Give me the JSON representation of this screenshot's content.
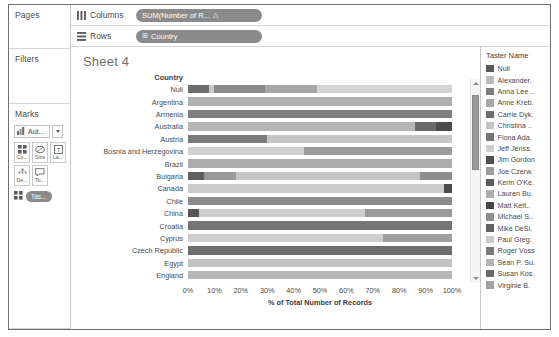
{
  "window": {
    "sheet_title": "Sheet 4"
  },
  "rail": {
    "pages": {
      "title": "Pages"
    },
    "filters": {
      "title": "Filters"
    },
    "marks": {
      "title": "Marks",
      "mark_type": {
        "label": "Aut...",
        "icon": "bar-mark-icon",
        "dropdown_icon": "chevron-down-icon"
      },
      "buttons": [
        {
          "name": "color",
          "caption": "Co...",
          "icon": "color-squares-icon"
        },
        {
          "name": "size",
          "caption": "Size",
          "icon": "size-icon"
        },
        {
          "name": "label",
          "caption": "La...",
          "icon": "label-text-icon"
        },
        {
          "name": "detail",
          "caption": "De...",
          "icon": "detail-icon"
        },
        {
          "name": "tooltip",
          "caption": "To...",
          "icon": "tooltip-icon"
        }
      ],
      "encoding_pill": {
        "label": "Tas...",
        "icon": "color-squares-icon"
      }
    }
  },
  "shelves": [
    {
      "name": "columns",
      "icon": "columns-icon",
      "label": "Columns",
      "pill": {
        "text": "SUM(Number of R...",
        "field_icon": "△"
      }
    },
    {
      "name": "rows",
      "icon": "rows-icon",
      "label": "Rows",
      "pill": {
        "text": "Country",
        "field_icon": "⊞"
      }
    }
  ],
  "legend": {
    "title": "Taster Name",
    "items": [
      {
        "label": "Null",
        "color": "#585858"
      },
      {
        "label": "Alexander.",
        "color": "#b9b9b9"
      },
      {
        "label": "Anna Lee ..",
        "color": "#7d7d7d"
      },
      {
        "label": "Anne Kreb.",
        "color": "#a8a8a8"
      },
      {
        "label": "Carrie Dyk.",
        "color": "#6e6e6e"
      },
      {
        "label": "Christina ..",
        "color": "#c4c4c4"
      },
      {
        "label": "Fiona Ada.",
        "color": "#757575"
      },
      {
        "label": "Jeff Jenss.",
        "color": "#cfcfcf"
      },
      {
        "label": "Jim Gordon",
        "color": "#4f4f4f"
      },
      {
        "label": "Joe Czerw.",
        "color": "#9c9c9c"
      },
      {
        "label": "Kerin O'Ke.",
        "color": "#5c5c5c"
      },
      {
        "label": "Lauren Bu.",
        "color": "#adadad"
      },
      {
        "label": "Matt Kett..",
        "color": "#464646"
      },
      {
        "label": "Michael S..",
        "color": "#8f8f8f"
      },
      {
        "label": "Mike DeSi.",
        "color": "#636363"
      },
      {
        "label": "Paul Greg.",
        "color": "#c9c9c9"
      },
      {
        "label": "Roger Voss",
        "color": "#7a7a7a"
      },
      {
        "label": "Sean P. Su.",
        "color": "#b3b3b3"
      },
      {
        "label": "Susan Kos.",
        "color": "#6a6a6a"
      },
      {
        "label": "Virginie B.",
        "color": "#a2a2a2"
      }
    ]
  },
  "chart_data": {
    "type": "bar",
    "orientation": "horizontal",
    "stacked": true,
    "normalized_percent": true,
    "title": "Sheet 4",
    "row_field_header": "Country",
    "xlabel": "% of Total Number of Records",
    "ylabel": "Country",
    "xlim": [
      0,
      100
    ],
    "xticks": [
      "0%",
      "10%",
      "20%",
      "30%",
      "40%",
      "50%",
      "60%",
      "70%",
      "80%",
      "90%",
      "100%"
    ],
    "grid": false,
    "legend_position": "right",
    "legend_title": "Taster Name",
    "categories": [
      "Null",
      "Argentina",
      "Armenia",
      "Australia",
      "Austria",
      "Bosnia and Herzegovina",
      "Brazil",
      "Bulgaria",
      "Canada",
      "Chile",
      "China",
      "Croatia",
      "Cyprus",
      "Czech Republic",
      "Egypt",
      "England"
    ],
    "rows": [
      {
        "category": "Null",
        "segments": [
          {
            "taster": "Null",
            "color": "#6e6e6e",
            "percent": 8
          },
          {
            "taster": "Alexander.",
            "color": "#c9c9c9",
            "percent": 2
          },
          {
            "taster": "Anna Lee ..",
            "color": "#8a8a8a",
            "percent": 19
          },
          {
            "taster": "Carrie Dyk.",
            "color": "#a6a6a6",
            "percent": 20
          },
          {
            "taster": "Christina ..",
            "color": "#d4d4d4",
            "percent": 51
          }
        ]
      },
      {
        "category": "Argentina",
        "segments": [
          {
            "taster": "Michael S..",
            "color": "#b0b0b0",
            "percent": 100
          }
        ]
      },
      {
        "category": "Armenia",
        "segments": [
          {
            "taster": "Mike DeSi.",
            "color": "#7e7e7e",
            "percent": 100
          }
        ]
      },
      {
        "category": "Australia",
        "segments": [
          {
            "taster": "Joe Czerw.",
            "color": "#b5b5b5",
            "percent": 86
          },
          {
            "taster": "Jim Gordon",
            "color": "#6a6a6a",
            "percent": 8
          },
          {
            "taster": "Kerin O'Ke.",
            "color": "#4d4d4d",
            "percent": 6
          }
        ]
      },
      {
        "category": "Austria",
        "segments": [
          {
            "taster": "Anne Kreb.",
            "color": "#7a7a7a",
            "percent": 30
          },
          {
            "taster": "Roger Voss",
            "color": "#c6c6c6",
            "percent": 70
          }
        ]
      },
      {
        "category": "Bosnia and Herzegovina",
        "segments": [
          {
            "taster": "Jeff Jenss.",
            "color": "#d0d0d0",
            "percent": 44
          },
          {
            "taster": "Lauren Bu.",
            "color": "#9c9c9c",
            "percent": 56
          }
        ]
      },
      {
        "category": "Brazil",
        "segments": [
          {
            "taster": "Sean P. Su.",
            "color": "#adadad",
            "percent": 100
          }
        ]
      },
      {
        "category": "Bulgaria",
        "segments": [
          {
            "taster": "Matt Kett..",
            "color": "#5e5e5e",
            "percent": 6
          },
          {
            "taster": "Paul Greg.",
            "color": "#9a9a9a",
            "percent": 12
          },
          {
            "taster": "Virginie B.",
            "color": "#c6c6c6",
            "percent": 70
          },
          {
            "taster": "Susan Kos.",
            "color": "#8d8d8d",
            "percent": 12
          }
        ]
      },
      {
        "category": "Canada",
        "segments": [
          {
            "taster": "Fiona Ada.",
            "color": "#cccccc",
            "percent": 97
          },
          {
            "taster": "Jim Gordon",
            "color": "#4a4a4a",
            "percent": 3
          }
        ]
      },
      {
        "category": "Chile",
        "segments": [
          {
            "taster": "Michael S..",
            "color": "#8c8c8c",
            "percent": 100
          }
        ]
      },
      {
        "category": "China",
        "segments": [
          {
            "taster": "Jim Gordon",
            "color": "#565656",
            "percent": 4
          },
          {
            "taster": "Jeff Jenss.",
            "color": "#cdcdcd",
            "percent": 63
          },
          {
            "taster": "Anna Lee ..",
            "color": "#9a9a9a",
            "percent": 33
          }
        ]
      },
      {
        "category": "Croatia",
        "segments": [
          {
            "taster": "Carrie Dyk.",
            "color": "#757575",
            "percent": 100
          }
        ]
      },
      {
        "category": "Cyprus",
        "segments": [
          {
            "taster": "Christina ..",
            "color": "#cfcfcf",
            "percent": 74
          },
          {
            "taster": "Joe Czerw.",
            "color": "#9e9e9e",
            "percent": 26
          }
        ]
      },
      {
        "category": "Czech Republic",
        "segments": [
          {
            "taster": "Kerin O'Ke.",
            "color": "#6d6d6d",
            "percent": 100
          }
        ]
      },
      {
        "category": "Egypt",
        "segments": [
          {
            "taster": "Paul Greg.",
            "color": "#c2c2c2",
            "percent": 100
          }
        ]
      },
      {
        "category": "England",
        "segments": [
          {
            "taster": "Roger Voss",
            "color": "#b8b8b8",
            "percent": 100
          }
        ]
      }
    ]
  },
  "scrollbar": {
    "up_icon": "triangle-up-icon",
    "down_icon": "triangle-down-icon",
    "thumb_top_percent": 4,
    "thumb_height_percent": 40
  }
}
